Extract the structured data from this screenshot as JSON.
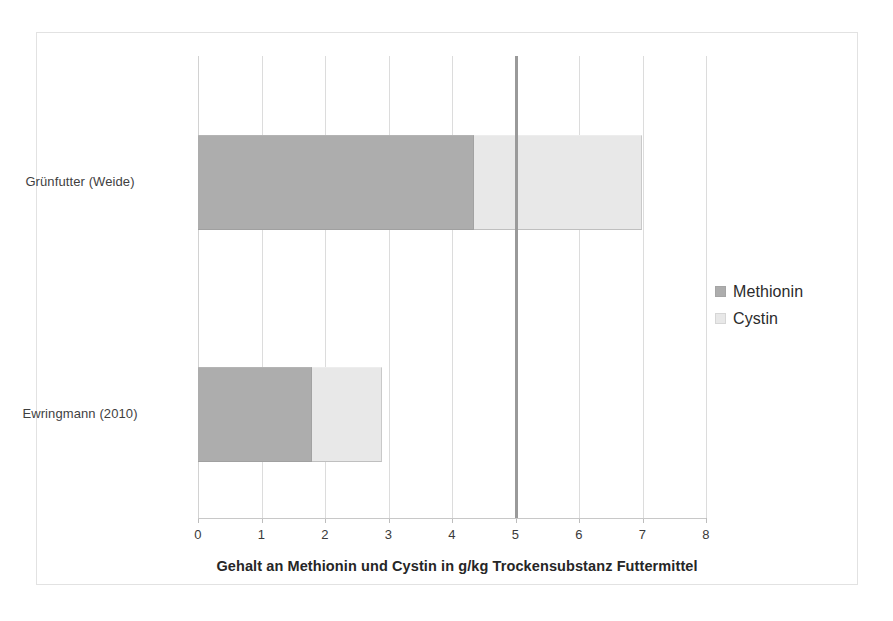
{
  "chart_data": {
    "type": "bar",
    "orientation": "horizontal",
    "stacked": true,
    "title": "",
    "xlabel": "Gehalt an Methionin und Cystin in g/kg Trockensubstanz Futtermittel",
    "ylabel": "",
    "xlim": [
      0,
      8
    ],
    "xticks": [
      "0",
      "1",
      "2",
      "3",
      "4",
      "5",
      "6",
      "7",
      "8"
    ],
    "xtick_values": [
      0,
      1,
      2,
      3,
      4,
      5,
      6,
      7,
      8
    ],
    "grid": "vertical",
    "legend_position": "right",
    "categories": [
      "Grünfutter (Weide)",
      "Ewringmann (2010)"
    ],
    "series": [
      {
        "name": "Methionin",
        "color": "#adadad",
        "values": [
          4.35,
          1.8
        ]
      },
      {
        "name": "Cystin",
        "color": "#e8e8e8",
        "values": [
          2.65,
          1.1
        ]
      }
    ],
    "totals": [
      7.0,
      2.9
    ],
    "annotations": [
      {
        "type": "vertical-reference-line",
        "value": 5,
        "color": "#9a9a9a",
        "label": ""
      }
    ]
  },
  "axis": {
    "title": "Gehalt an Methionin und Cystin in g/kg Trockensubstanz Futtermittel",
    "ticks": [
      "0",
      "1",
      "2",
      "3",
      "4",
      "5",
      "6",
      "7",
      "8"
    ]
  },
  "categories": [
    {
      "label": "Grünfutter (Weide)"
    },
    {
      "label": "Ewringmann (2010)"
    }
  ],
  "legend": {
    "items": [
      {
        "label": "Methionin",
        "color": "#adadad"
      },
      {
        "label": "Cystin",
        "color": "#e8e8e8"
      }
    ]
  }
}
